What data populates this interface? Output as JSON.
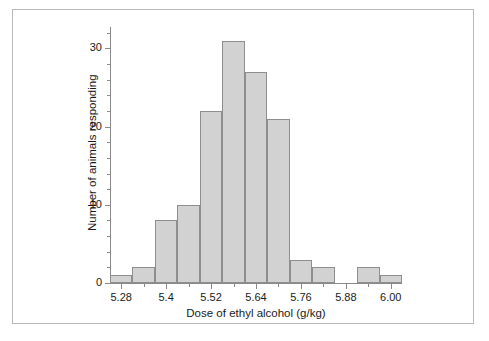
{
  "figure": {
    "background_color": "#ffffff",
    "frame_color": "#b9b9b9",
    "axis_color": "#8a8a8a"
  },
  "chart_data": {
    "type": "bar",
    "chart_subtype": "histogram",
    "title": "",
    "subtitle": "",
    "xlabel": "Dose of ethyl alcohol (g/kg)",
    "ylabel": "Number of animals responding",
    "bar_fill_color": "#d2d2d2",
    "bar_edge_color": "#8e8e8e",
    "grid": false,
    "legend": null,
    "legend_position": "none",
    "bin_width": 0.03,
    "bin_start": 5.25,
    "bin_end": 6.06,
    "categories": [
      "5.25-5.28",
      "5.28-5.31",
      "5.31-5.34",
      "5.34-5.37",
      "5.37-5.40",
      "5.40-5.43",
      "5.43-5.46",
      "5.46-5.49",
      "5.49-5.52",
      "5.52-5.55",
      "5.55-5.58",
      "5.58-5.61",
      "5.61-5.64"
    ],
    "bins": [
      {
        "x0": 5.25,
        "x1": 5.31,
        "value": 1
      },
      {
        "x0": 5.31,
        "x1": 5.37,
        "value": 2
      },
      {
        "x0": 5.37,
        "x1": 5.43,
        "value": 8
      },
      {
        "x0": 5.43,
        "x1": 5.49,
        "value": 10
      },
      {
        "x0": 5.49,
        "x1": 5.55,
        "value": 22
      },
      {
        "x0": 5.55,
        "x1": 5.61,
        "value": 31
      },
      {
        "x0": 5.61,
        "x1": 5.67,
        "value": 27
      },
      {
        "x0": 5.67,
        "x1": 5.73,
        "value": 21
      },
      {
        "x0": 5.73,
        "x1": 5.79,
        "value": 3
      },
      {
        "x0": 5.79,
        "x1": 5.85,
        "value": 2
      },
      {
        "x0": 5.85,
        "x1": 5.91,
        "value": 0
      },
      {
        "x0": 5.91,
        "x1": 5.97,
        "value": 2
      },
      {
        "x0": 5.97,
        "x1": 6.03,
        "value": 1
      }
    ],
    "values": [
      1,
      2,
      8,
      10,
      22,
      31,
      27,
      21,
      3,
      2,
      0,
      2,
      1
    ],
    "x": [
      5.28,
      5.34,
      5.4,
      5.46,
      5.52,
      5.58,
      5.64,
      5.7,
      5.76,
      5.82,
      5.88,
      5.94,
      6.0
    ],
    "xlim": [
      5.25,
      6.03
    ],
    "ylim": [
      0,
      33
    ],
    "xticks_major": [
      5.28,
      5.4,
      5.52,
      5.64,
      5.76,
      5.88,
      6.0
    ],
    "xticks_minor": [
      5.34,
      5.46,
      5.58,
      5.7,
      5.82,
      5.94
    ],
    "xticklabels": [
      "5.28",
      "5.4",
      "5.52",
      "5.64",
      "5.76",
      "5.88",
      "6.00"
    ],
    "yticks_major": [
      0,
      10,
      20,
      30
    ],
    "yticks_minor": [
      2,
      4,
      6,
      8,
      12,
      14,
      16,
      18,
      22,
      24,
      26,
      28,
      32
    ],
    "yticklabels": [
      "0",
      "10",
      "20",
      "30"
    ]
  }
}
